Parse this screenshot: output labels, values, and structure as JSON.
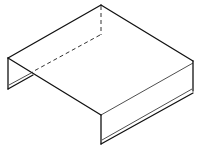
{
  "figure": {
    "line_color": "#111111",
    "background": "#ffffff",
    "parts": [
      "top-face",
      "left-flange",
      "front-flange",
      "hidden-back-edges"
    ]
  }
}
